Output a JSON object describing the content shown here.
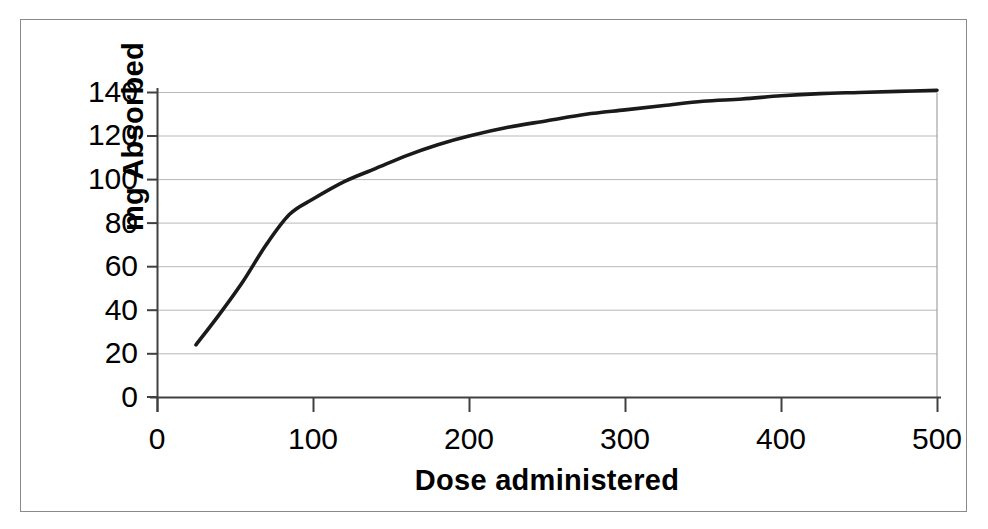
{
  "chart_data": {
    "type": "line",
    "title": "",
    "subtitle": "",
    "xlabel": "Dose administered",
    "ylabel": "mg Absorbed",
    "xlim": [
      0,
      500
    ],
    "ylim": [
      0,
      140
    ],
    "xticks": [
      "0",
      "100",
      "200",
      "300",
      "400",
      "500"
    ],
    "xtick_values": [
      0,
      100,
      200,
      300,
      400,
      500
    ],
    "yticks": [
      "0",
      "20",
      "40",
      "60",
      "80",
      "100",
      "120",
      "140"
    ],
    "ytick_values": [
      0,
      20,
      40,
      60,
      80,
      100,
      120,
      140
    ],
    "grid": "horizontal",
    "legend": "none",
    "series": [
      {
        "name": "mg Absorbed",
        "color": "#1a1a1a",
        "line_width": 3.6,
        "x": [
          25,
          40,
          55,
          70,
          85,
          100,
          120,
          140,
          160,
          180,
          200,
          225,
          250,
          275,
          300,
          325,
          350,
          375,
          400,
          425,
          450,
          475,
          500
        ],
        "values": [
          24,
          38,
          53,
          70,
          84,
          91,
          99,
          105,
          111,
          116,
          120,
          124,
          127,
          130,
          132,
          134,
          136,
          137,
          138.5,
          139.5,
          140,
          140.5,
          141
        ]
      }
    ],
    "annotations": []
  },
  "axes": {
    "x_title": "Dose administered",
    "y_title": "mg Absorbed",
    "x_labels": [
      "0",
      "100",
      "200",
      "300",
      "400",
      "500"
    ],
    "y_labels": [
      "140",
      "120",
      "100",
      "80",
      "60",
      "40",
      "20",
      "0"
    ]
  },
  "style": {
    "frame_color": "#8a8a8a",
    "gridline_color": "#b8b8b8",
    "axis_color": "#404040",
    "curve_color": "#1a1a1a",
    "background": "#ffffff",
    "text_color": "#000000"
  }
}
